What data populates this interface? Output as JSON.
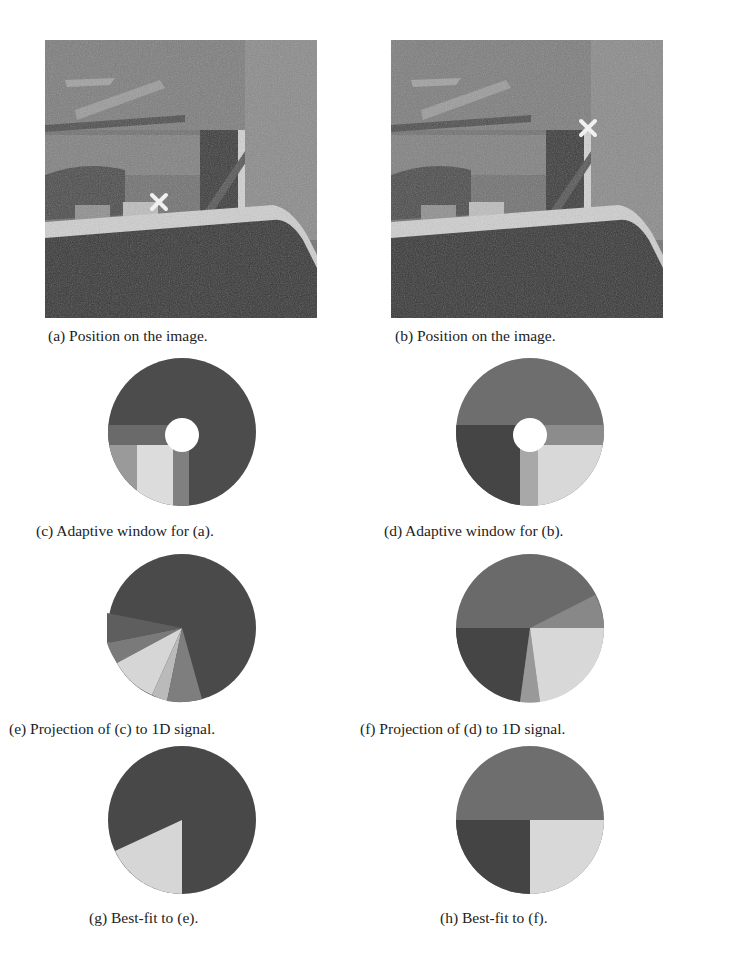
{
  "figure": {
    "panels": [
      {
        "id": "a",
        "caption": "(a) Position on the image.",
        "type": "photo",
        "marker": "x",
        "marker_pos": [
          0.4,
          0.58
        ]
      },
      {
        "id": "b",
        "caption": "(b) Position on the image.",
        "type": "photo",
        "marker": "x",
        "marker_pos": [
          0.73,
          0.31
        ]
      },
      {
        "id": "c",
        "caption": "(c) Adaptive window for (a).",
        "type": "adaptive-window"
      },
      {
        "id": "d",
        "caption": "(d) Adaptive window for (b).",
        "type": "adaptive-window"
      },
      {
        "id": "e",
        "caption": "(e) Projection of (c) to 1D signal.",
        "type": "projection"
      },
      {
        "id": "f",
        "caption": "(f) Projection of (d) to 1D signal.",
        "type": "projection"
      },
      {
        "id": "g",
        "caption": "(g) Best-fit to (e).",
        "type": "best-fit"
      },
      {
        "id": "h",
        "caption": "(h) Best-fit to (f).",
        "type": "best-fit"
      }
    ],
    "colors": {
      "dark": "#4a4a4a",
      "mid": "#6e6e6e",
      "light": "#d8d8d8",
      "darker": "#3e3e3e",
      "marker": "#f2f2f2"
    }
  }
}
